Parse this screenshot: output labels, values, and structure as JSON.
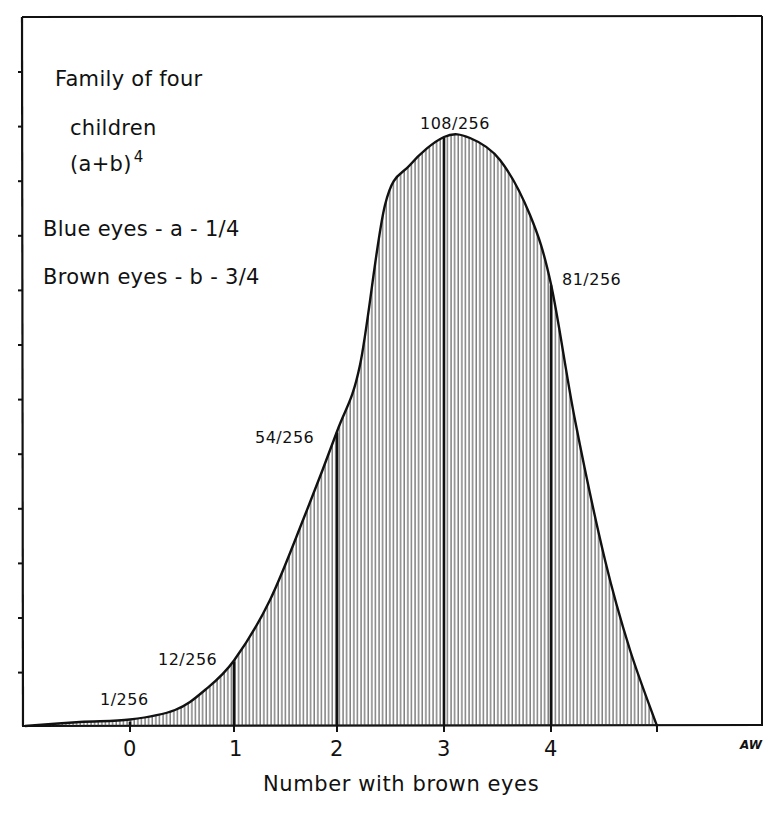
{
  "legend": {
    "line1": "Family of four",
    "line2": "children",
    "line3_base": "(a+b)",
    "line3_exp": "4",
    "line4": "Blue eyes - a - 1/4",
    "line5": "Brown eyes - b - 3/4"
  },
  "data_labels": [
    "1/256",
    "12/256",
    "54/256",
    "108/256",
    "81/256"
  ],
  "x_ticks": [
    "0",
    "1",
    "2",
    "3",
    "4"
  ],
  "x_axis_title": "Number with brown eyes",
  "signature": "AW",
  "colors": {
    "ink": "#111111",
    "background": "#ffffff"
  },
  "chart_data": {
    "type": "area",
    "subtitle": "Blue eyes - a - 1/4; Brown eyes - b - 3/4",
    "xlabel": "Number with brown eyes",
    "ylabel": "",
    "categories": [
      "0",
      "1",
      "2",
      "3",
      "4"
    ],
    "x": [
      0,
      1,
      2,
      3,
      4
    ],
    "values": [
      1,
      12,
      54,
      108,
      81
    ],
    "value_labels": [
      "1/256",
      "12/256",
      "54/256",
      "108/256",
      "81/256"
    ],
    "denominator": 256,
    "probabilities": [
      0.0039,
      0.0469,
      0.2109,
      0.4219,
      0.3164
    ],
    "ylim": [
      0,
      128
    ],
    "y_ticks_unlabeled": true,
    "fill": "vertical hatching",
    "grid": false,
    "legend_position": "upper-left (text annotation)"
  }
}
